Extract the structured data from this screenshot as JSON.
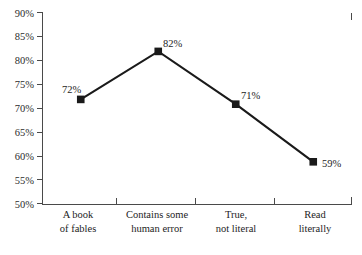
{
  "chart_data": {
    "type": "line",
    "title": "",
    "subtitle": "",
    "xlabel": "",
    "ylabel": "",
    "categories": [
      "A book\nof fables",
      "Contains some\nhuman error",
      "True,\nnot literal",
      "Read\nliterally"
    ],
    "category_lines": [
      [
        "A book",
        "of fables"
      ],
      [
        "Contains some",
        "human error"
      ],
      [
        "True,",
        "not literal"
      ],
      [
        "Read",
        "literally"
      ]
    ],
    "values": [
      72,
      82,
      71,
      59
    ],
    "point_labels": [
      "72%",
      "82%",
      "71%",
      "59%"
    ],
    "ylim": [
      50,
      90
    ],
    "ytick_values": [
      90,
      85,
      80,
      75,
      70,
      65,
      60,
      55,
      50
    ],
    "ytick_labels": [
      "90%",
      "85%",
      "80%",
      "75%",
      "70%",
      "65%",
      "60%",
      "55%",
      "50%"
    ],
    "grid": false,
    "legend": false,
    "legend_position": "none",
    "marker": "square",
    "series_color": "#1a1a1a",
    "axis_color": "#4a4a4a",
    "text_color": "#1d1d1d"
  }
}
